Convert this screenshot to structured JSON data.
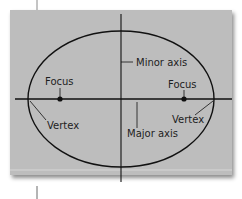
{
  "diagram": {
    "colors": {
      "background": "#bdbdbd",
      "stroke": "#111111",
      "text": "#1e1e1e"
    },
    "labels": {
      "minor_axis": "Minor axis",
      "major_axis": "Major axis",
      "focus_left": "Focus",
      "focus_right": "Focus",
      "vertex_left": "Vertex",
      "vertex_right": "Vertex"
    },
    "ellipse": {
      "cx": 121,
      "cy": 99,
      "rx": 93,
      "ry": 68
    },
    "foci": [
      {
        "x": 60,
        "y": 99
      },
      {
        "x": 184,
        "y": 99
      }
    ]
  }
}
